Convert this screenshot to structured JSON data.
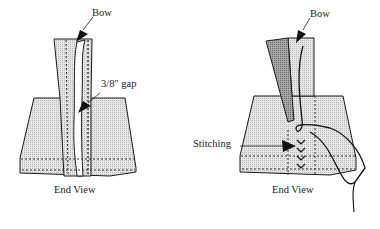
{
  "figure_left": {
    "labels": {
      "bow": "Bow",
      "gap": "3/8\" gap",
      "view": "End View"
    }
  },
  "figure_right": {
    "labels": {
      "bow": "Bow",
      "stitching": "Stitching",
      "view": "End View"
    }
  },
  "colors": {
    "line": "#1a1a1a",
    "fill_light": "#d6d6d6",
    "fill_dark": "#9a9a9a",
    "background": "#ffffff"
  }
}
